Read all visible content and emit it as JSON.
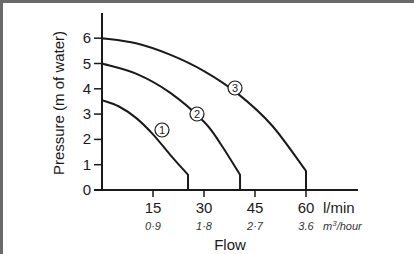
{
  "chart_data": {
    "type": "line",
    "title": "",
    "xlabel": "Flow",
    "ylabel": "Pressure (m of water)",
    "x_unit_primary": "l/min",
    "x_unit_secondary": "m³/hour",
    "xlim": [
      0,
      75
    ],
    "ylim": [
      0,
      6.9
    ],
    "grid": false,
    "legend": "inline circled numbers on curves",
    "x_ticks": [
      {
        "value": 15,
        "label": "15",
        "sub": "0·9"
      },
      {
        "value": 30,
        "label": "30",
        "sub": "1·8"
      },
      {
        "value": 45,
        "label": "45",
        "sub": "2·7"
      },
      {
        "value": 60,
        "label": "60",
        "sub": "3.6"
      }
    ],
    "y_ticks": [
      0,
      1,
      2,
      3,
      4,
      5,
      6
    ],
    "series": [
      {
        "name": "①",
        "id": 1,
        "x": [
          0,
          5,
          10,
          15,
          20,
          25.3,
          25.3
        ],
        "y": [
          3.55,
          3.3,
          2.85,
          2.2,
          1.4,
          0.6,
          0
        ]
      },
      {
        "name": "②",
        "id": 2,
        "x": [
          0,
          10,
          20,
          30,
          35,
          40.6,
          40.6
        ],
        "y": [
          5.0,
          4.6,
          3.85,
          2.7,
          1.8,
          0.6,
          0
        ]
      },
      {
        "name": "③",
        "id": 3,
        "x": [
          0,
          10,
          20,
          30,
          40,
          50,
          60,
          60
        ],
        "y": [
          6.0,
          5.8,
          5.35,
          4.7,
          3.8,
          2.55,
          0.75,
          0
        ]
      }
    ]
  },
  "labels": {
    "y_axis_title": "Pressure (m of water)",
    "x_axis_title": "Flow",
    "x_unit_primary": "l/min",
    "x_unit_secondary_base": "m",
    "x_unit_secondary_sup": "3",
    "x_unit_secondary_rest": "/hour",
    "curve1": "1",
    "curve2": "2",
    "curve3": "3"
  }
}
